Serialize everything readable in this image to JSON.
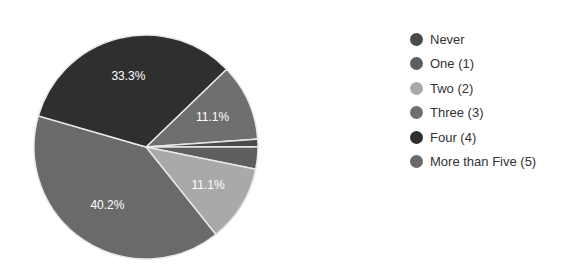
{
  "chart_data": {
    "type": "pie",
    "title": "",
    "categories": [
      "Never",
      "One (1)",
      "Two (2)",
      "Three (3)",
      "Four (4)",
      "More than Five (5)"
    ],
    "values": [
      1.1,
      3.2,
      11.1,
      11.1,
      33.3,
      40.2
    ],
    "data_labels": [
      "",
      "",
      "11.1%",
      "11.1%",
      "33.3%",
      "40.2%"
    ],
    "colors": [
      "#4a4a4a",
      "#5e5e5e",
      "#a9a9a9",
      "#6f6f6f",
      "#2f2f2f",
      "#6a6a6a"
    ],
    "draw_order": [
      "Three (3)",
      "Never",
      "One (1)",
      "Two (2)",
      "More than Five (5)",
      "Four (4)"
    ],
    "start_angle_deg": 316,
    "legend_position": "right"
  },
  "legend": {
    "items": [
      {
        "label": "Never",
        "color": "#4a4a4a"
      },
      {
        "label": "One (1)",
        "color": "#5e5e5e"
      },
      {
        "label": "Two (2)",
        "color": "#a9a9a9"
      },
      {
        "label": "Three (3)",
        "color": "#6f6f6f"
      },
      {
        "label": "Four (4)",
        "color": "#2f2f2f"
      },
      {
        "label": "More than Five (5)",
        "color": "#6a6a6a"
      }
    ]
  }
}
